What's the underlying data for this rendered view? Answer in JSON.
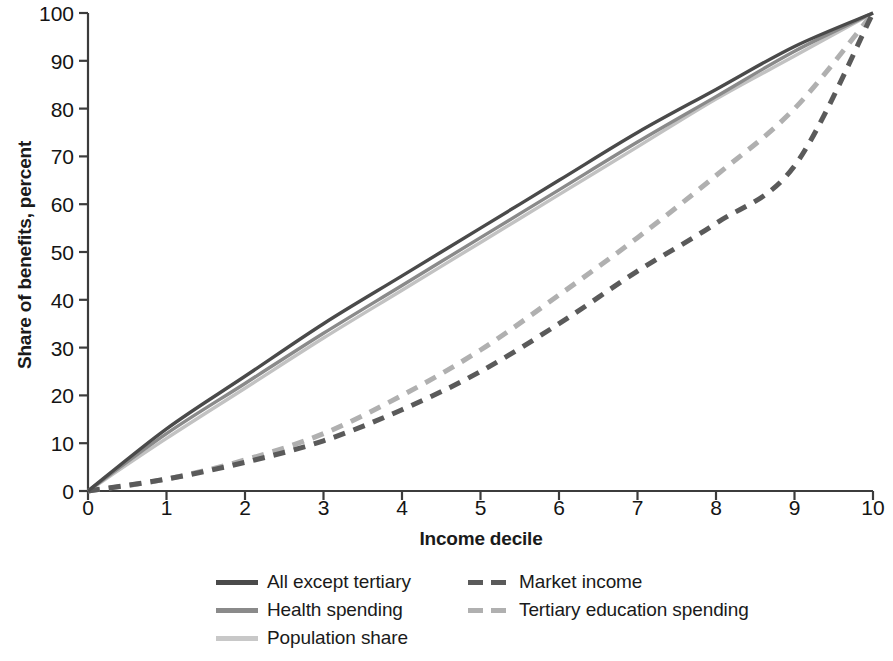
{
  "chart_data": {
    "type": "line",
    "title": "",
    "xlabel": "Income decile",
    "ylabel": "Share of benefits, percent",
    "xlim": [
      0,
      10
    ],
    "ylim": [
      0,
      100
    ],
    "grid": false,
    "legend_position": "bottom",
    "x_ticks": [
      "0",
      "1",
      "2",
      "3",
      "4",
      "5",
      "6",
      "7",
      "8",
      "9",
      "10"
    ],
    "y_ticks": [
      "0",
      "10",
      "20",
      "30",
      "40",
      "50",
      "60",
      "70",
      "80",
      "90",
      "100"
    ],
    "x": [
      0,
      1,
      2,
      3,
      4,
      5,
      6,
      7,
      8,
      9,
      10
    ],
    "series": [
      {
        "name": "All except tertiary",
        "style": "solid",
        "color": "#4a4a4a",
        "values": [
          0,
          13,
          24,
          35,
          45,
          55,
          65,
          75,
          84,
          93,
          100
        ]
      },
      {
        "name": "Health spending",
        "style": "solid",
        "color": "#8a8a8a",
        "values": [
          0,
          12,
          22.5,
          33,
          43,
          53,
          63,
          73,
          82.5,
          92,
          100
        ]
      },
      {
        "name": "Population share",
        "style": "solid",
        "color": "#c2c2c2",
        "values": [
          0,
          11,
          21.5,
          32,
          42,
          52,
          62,
          72,
          82,
          91,
          100
        ]
      },
      {
        "name": "Market income",
        "style": "dashed",
        "color": "#5a5a5a",
        "values": [
          0,
          2.5,
          6,
          10.5,
          17,
          25,
          35,
          46,
          56,
          68,
          100
        ]
      },
      {
        "name": "Tertiary education spending",
        "style": "dashed",
        "color": "#b0b0b0",
        "values": [
          0,
          2.5,
          6.5,
          12,
          20,
          29.5,
          41,
          53,
          66,
          80,
          100
        ]
      }
    ]
  },
  "axes": {
    "ylabel": "Share of benefits, percent",
    "xlabel": "Income decile",
    "y_ticks": [
      "100",
      "90",
      "80",
      "70",
      "60",
      "50",
      "40",
      "30",
      "20",
      "10",
      "0"
    ],
    "x_ticks": [
      "0",
      "1",
      "2",
      "3",
      "4",
      "5",
      "6",
      "7",
      "8",
      "9",
      "10"
    ]
  },
  "legend": {
    "column1": [
      {
        "label": "All except tertiary",
        "style": "solid",
        "color": "#4a4a4a"
      },
      {
        "label": "Health spending",
        "style": "solid",
        "color": "#8a8a8a"
      },
      {
        "label": "Population share",
        "style": "solid",
        "color": "#c8c8c8"
      }
    ],
    "column2": [
      {
        "label": "Market income",
        "style": "dashed",
        "color": "#5a5a5a"
      },
      {
        "label": "Tertiary education spending",
        "style": "dashed",
        "color": "#b0b0b0"
      }
    ]
  }
}
